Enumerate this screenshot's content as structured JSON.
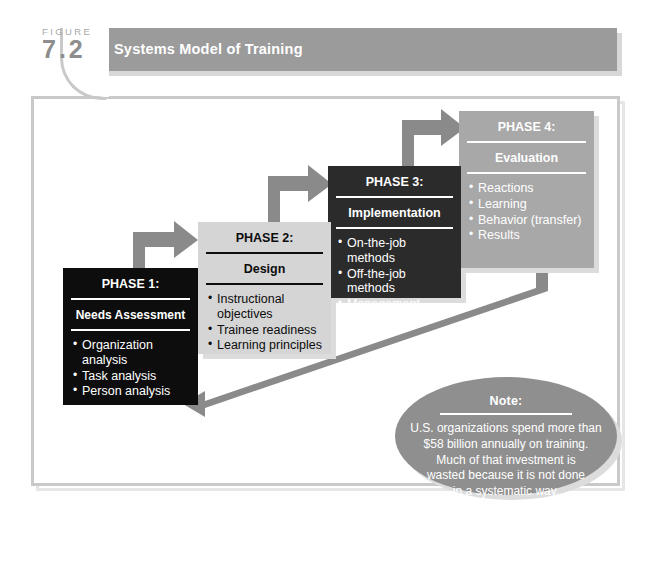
{
  "figure": {
    "label_word": "FIGURE",
    "number": "7.2",
    "title": "Systems Model of Training"
  },
  "phases": [
    {
      "id": "phase-1",
      "title": "PHASE 1:",
      "subtitle": "Needs Assessment",
      "items": [
        "Organization analysis",
        "Task analysis",
        "Person analysis"
      ],
      "fill": "#0d0d0d",
      "text_color": "#ffffff"
    },
    {
      "id": "phase-2",
      "title": "PHASE 2:",
      "subtitle": "Design",
      "items": [
        "Instructional objectives",
        "Trainee readiness",
        "Learning principles"
      ],
      "fill": "#d5d5d5",
      "text_color": "#0d0d0d"
    },
    {
      "id": "phase-3",
      "title": "PHASE 3:",
      "subtitle": "Implementation",
      "items": [
        "On-the-job methods",
        "Off-the-job methods",
        "Management development"
      ],
      "fill": "#2b2b2b",
      "text_color": "#ffffff"
    },
    {
      "id": "phase-4",
      "title": "PHASE 4:",
      "subtitle": "Evaluation",
      "items": [
        "Reactions",
        "Learning",
        "Behavior (transfer)",
        "Results"
      ],
      "fill": "#a8a8a8",
      "text_color": "#ffffff"
    }
  ],
  "note": {
    "title": "Note:",
    "lines": [
      "U.S. organizations spend more than",
      "$58 billion annually on training.",
      "Much of that investment is",
      "wasted because it is not done",
      "in a systematic way."
    ],
    "fill": "#8f8f8f"
  },
  "arrows": {
    "connector_color": "#8a8a8a",
    "feedback_color": "#8a8a8a",
    "flow_1_to_2": "arrow-phase1-to-phase2",
    "flow_2_to_3": "arrow-phase2-to-phase3",
    "flow_3_to_4": "arrow-phase3-to-phase4",
    "feedback_4_to_1": "arrow-phase4-feedback-to-phase1"
  },
  "colors": {
    "frame_border": "#c9c9c9",
    "header_bar": "#9b9b9b",
    "page_background": "#ffffff"
  }
}
